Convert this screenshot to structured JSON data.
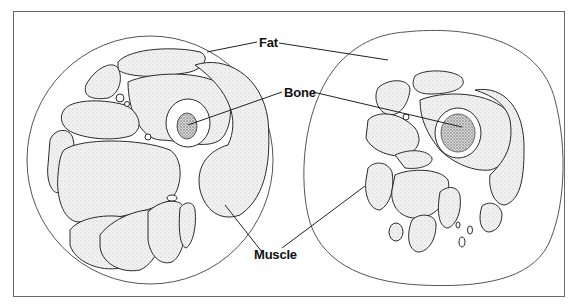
{
  "diagram": {
    "panels": [
      {
        "id": "left",
        "description": "Cross-section with large muscle mass and thin fat layer"
      },
      {
        "id": "right",
        "description": "Cross-section with smaller muscles and thick fat layer"
      }
    ],
    "labels": {
      "fat": "Fat",
      "bone": "Bone",
      "muscle": "Muscle"
    },
    "colors": {
      "outline": "#2a2a2a",
      "muscle_fill": "#ececec",
      "bone_marrow": "#9a9a9a",
      "frame": "#6a6a6a",
      "background": "#ffffff"
    }
  }
}
